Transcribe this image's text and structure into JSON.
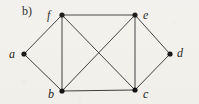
{
  "figure": {
    "part_label": "b)",
    "background_color": "#f3f1ec",
    "edge_color": "#3c3c3c",
    "vertex_color": "#111111",
    "width": 199,
    "height": 104
  },
  "chart_data": {
    "type": "diagram",
    "diagram_kind": "undirected-graph",
    "title": "b)",
    "vertex_count": 6,
    "edge_count": 10,
    "nodes": [
      {
        "id": "a",
        "label": "a",
        "x": 24,
        "y": 54,
        "label_x": 9,
        "label_y": 48,
        "degree": 2
      },
      {
        "id": "b",
        "label": "b",
        "x": 62,
        "y": 91,
        "label_x": 48,
        "label_y": 88,
        "degree": 4
      },
      {
        "id": "c",
        "label": "c",
        "x": 135,
        "y": 90,
        "label_x": 143,
        "label_y": 88,
        "degree": 4
      },
      {
        "id": "d",
        "label": "d",
        "x": 170,
        "y": 54,
        "label_x": 177,
        "label_y": 47,
        "degree": 2
      },
      {
        "id": "e",
        "label": "e",
        "x": 135,
        "y": 15,
        "label_x": 143,
        "label_y": 9,
        "degree": 4
      },
      {
        "id": "f",
        "label": "f",
        "x": 62,
        "y": 15,
        "label_x": 47,
        "label_y": 9,
        "degree": 4
      }
    ],
    "edges": [
      {
        "from": "a",
        "to": "f"
      },
      {
        "from": "a",
        "to": "b"
      },
      {
        "from": "f",
        "to": "e"
      },
      {
        "from": "f",
        "to": "b"
      },
      {
        "from": "f",
        "to": "c"
      },
      {
        "from": "e",
        "to": "b"
      },
      {
        "from": "e",
        "to": "c"
      },
      {
        "from": "e",
        "to": "d"
      },
      {
        "from": "b",
        "to": "c"
      },
      {
        "from": "c",
        "to": "d"
      }
    ]
  }
}
